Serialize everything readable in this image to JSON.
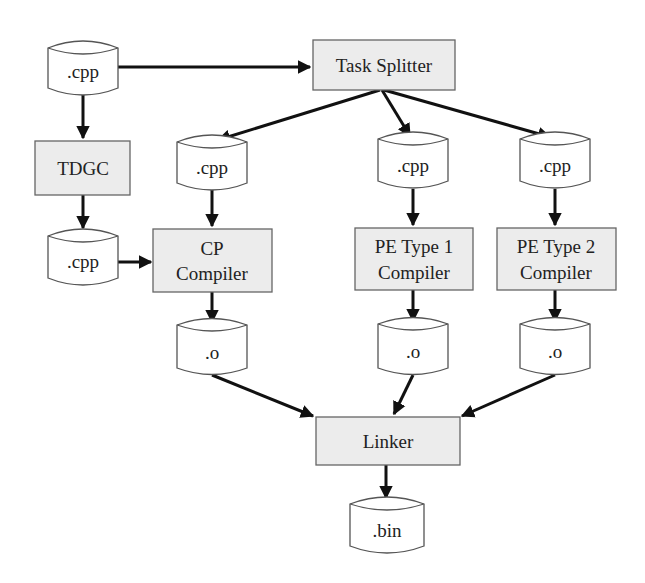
{
  "diagram": {
    "nodes": {
      "cpp_source": {
        "label": ".cpp",
        "shape": "cylinder"
      },
      "task_splitter": {
        "label": "Task Splitter",
        "shape": "box"
      },
      "tdgc": {
        "label": "TDGC",
        "shape": "box"
      },
      "cpp_tdgc_out": {
        "label": ".cpp",
        "shape": "cylinder"
      },
      "cpp_cp": {
        "label": ".cpp",
        "shape": "cylinder"
      },
      "cpp_pe1": {
        "label": ".cpp",
        "shape": "cylinder"
      },
      "cpp_pe2": {
        "label": ".cpp",
        "shape": "cylinder"
      },
      "cp_compiler": {
        "line1": "CP",
        "line2": "Compiler",
        "shape": "box"
      },
      "pe1_compiler": {
        "line1": "PE Type 1",
        "line2": "Compiler",
        "shape": "box"
      },
      "pe2_compiler": {
        "line1": "PE Type 2",
        "line2": "Compiler",
        "shape": "box"
      },
      "obj_cp": {
        "label": ".o",
        "shape": "cylinder"
      },
      "obj_pe1": {
        "label": ".o",
        "shape": "cylinder"
      },
      "obj_pe2": {
        "label": ".o",
        "shape": "cylinder"
      },
      "linker": {
        "label": "Linker",
        "shape": "box"
      },
      "bin": {
        "label": ".bin",
        "shape": "cylinder"
      }
    },
    "edges": [
      [
        "cpp_source",
        "task_splitter"
      ],
      [
        "cpp_source",
        "tdgc"
      ],
      [
        "tdgc",
        "cpp_tdgc_out"
      ],
      [
        "cpp_tdgc_out",
        "cp_compiler"
      ],
      [
        "task_splitter",
        "cpp_cp"
      ],
      [
        "task_splitter",
        "cpp_pe1"
      ],
      [
        "task_splitter",
        "cpp_pe2"
      ],
      [
        "cpp_cp",
        "cp_compiler"
      ],
      [
        "cpp_pe1",
        "pe1_compiler"
      ],
      [
        "cpp_pe2",
        "pe2_compiler"
      ],
      [
        "cp_compiler",
        "obj_cp"
      ],
      [
        "pe1_compiler",
        "obj_pe1"
      ],
      [
        "pe2_compiler",
        "obj_pe2"
      ],
      [
        "obj_cp",
        "linker"
      ],
      [
        "obj_pe1",
        "linker"
      ],
      [
        "obj_pe2",
        "linker"
      ],
      [
        "linker",
        "bin"
      ]
    ],
    "colors": {
      "box_fill": "#ececec",
      "box_stroke": "#666666",
      "cylinder_fill": "#ffffff",
      "edge": "#111111"
    }
  }
}
